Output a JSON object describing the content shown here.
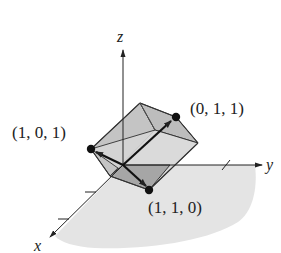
{
  "diagram": {
    "axes": {
      "x_label": "x",
      "y_label": "y",
      "z_label": "z"
    },
    "points": [
      {
        "label": "(1, 0, 1)",
        "coords": [
          1,
          0,
          1
        ]
      },
      {
        "label": "(0, 1, 1)",
        "coords": [
          0,
          1,
          1
        ]
      },
      {
        "label": "(1, 1, 0)",
        "coords": [
          1,
          1,
          0
        ]
      }
    ],
    "colors": {
      "cube_face": "#c8c8c8",
      "cube_face_light": "#dcdcdc",
      "cube_face_dark": "#a8a8a8",
      "plane": "#e4e4e4",
      "stroke": "#222222"
    }
  }
}
